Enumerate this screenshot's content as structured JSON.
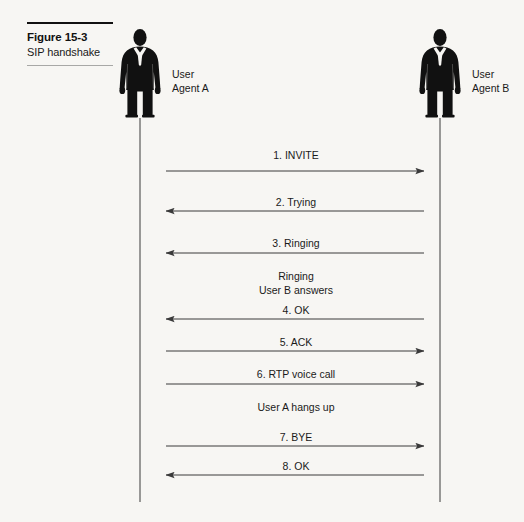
{
  "figure": {
    "caption_number": "Figure 15-3",
    "caption_title": "SIP handshake",
    "background_color": "#f7f6f3",
    "line_color": "#3a3a3a",
    "silhouette_color": "#111111"
  },
  "actors": [
    {
      "id": "user-agent-a",
      "name_line1": "User",
      "name_line2": "Agent A",
      "lifeline_x": 140,
      "lifeline_top": 118,
      "lifeline_bottom": 502
    },
    {
      "id": "user-agent-b",
      "name_line1": "User",
      "name_line2": "Agent B",
      "lifeline_x": 440,
      "lifeline_top": 118,
      "lifeline_bottom": 502
    }
  ],
  "chart_data": {
    "type": "diagram",
    "diagram_kind": "sequence",
    "title": "SIP handshake",
    "participants": [
      "User Agent A",
      "User Agent B"
    ],
    "messages": [
      {
        "step": 1,
        "label": "1. INVITE",
        "from": "User Agent A",
        "to": "User Agent B",
        "direction": "right",
        "y": 171,
        "label_y": 149
      },
      {
        "step": 2,
        "label": "2. Trying",
        "from": "User Agent B",
        "to": "User Agent A",
        "direction": "left",
        "y": 211,
        "label_y": 196
      },
      {
        "step": 3,
        "label": "3. Ringing",
        "from": "User Agent B",
        "to": "User Agent A",
        "direction": "left",
        "y": 253,
        "label_y": 237
      },
      {
        "step": 4,
        "label": "4. OK",
        "from": "User Agent B",
        "to": "User Agent A",
        "direction": "left",
        "y": 319,
        "label_y": 304
      },
      {
        "step": 5,
        "label": "5. ACK",
        "from": "User Agent A",
        "to": "User Agent B",
        "direction": "right",
        "y": 351,
        "label_y": 336
      },
      {
        "step": 6,
        "label": "6. RTP voice call",
        "from": "User Agent A",
        "to": "User Agent B",
        "direction": "right",
        "y": 384,
        "label_y": 368
      },
      {
        "step": 7,
        "label": "7. BYE",
        "from": "User Agent A",
        "to": "User Agent B",
        "direction": "right",
        "y": 446,
        "label_y": 431
      },
      {
        "step": 8,
        "label": "8. OK",
        "from": "User Agent B",
        "to": "User Agent A",
        "direction": "left",
        "y": 475,
        "label_y": 460
      }
    ],
    "notes": [
      {
        "id": "note-ringing",
        "line1": "Ringing",
        "line2": "User B answers",
        "y": 269
      },
      {
        "id": "note-hangs-up",
        "line1": "User A hangs up",
        "line2": "",
        "y": 400
      }
    ],
    "arrow_start_x": 166,
    "arrow_end_x": 424,
    "label_center_x": 296
  }
}
